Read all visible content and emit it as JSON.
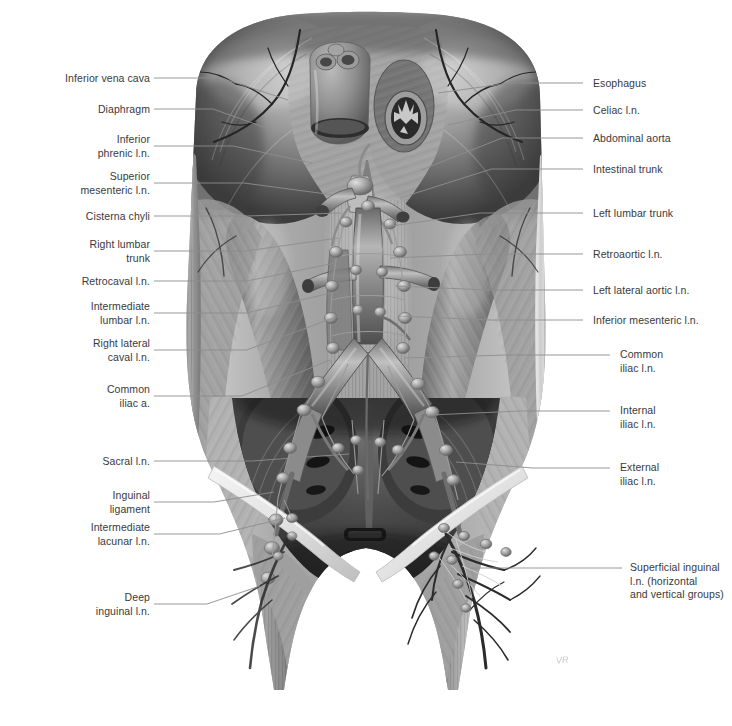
{
  "figure": {
    "background_color": "#ffffff",
    "label_color": "#39393b",
    "leader_color": "#8d8d90",
    "signature": "VR"
  },
  "labels_left": [
    {
      "id": "inferior-vena-cava",
      "text": "Inferior vena cava",
      "x": 35,
      "y": 72,
      "w": 115,
      "lx": 154,
      "ly": 78,
      "tx": 288,
      "ty": 100
    },
    {
      "id": "diaphragm",
      "text": "Diaphragm",
      "x": 35,
      "y": 103,
      "w": 115,
      "lx": 154,
      "ly": 109,
      "tx": 272,
      "ty": 130
    },
    {
      "id": "inferior-phrenic-ln",
      "text": "Inferior\nphrenic l.n.",
      "x": 35,
      "y": 133,
      "w": 115,
      "lx": 154,
      "ly": 146,
      "tx": 312,
      "ty": 163
    },
    {
      "id": "superior-mesenteric-ln",
      "text": "Superior\nmesenteric l.n.",
      "x": 25,
      "y": 170,
      "w": 125,
      "lx": 154,
      "ly": 183,
      "tx": 334,
      "ty": 195
    },
    {
      "id": "cisterna-chyli",
      "text": "Cisterna chyli",
      "x": 35,
      "y": 210,
      "w": 115,
      "lx": 154,
      "ly": 216,
      "tx": 341,
      "ty": 213
    },
    {
      "id": "right-lumbar-trunk",
      "text": "Right lumbar\ntrunk",
      "x": 35,
      "y": 238,
      "w": 115,
      "lx": 154,
      "ly": 251,
      "tx": 338,
      "ty": 238
    },
    {
      "id": "retrocaval-ln",
      "text": "Retrocaval l.n.",
      "x": 35,
      "y": 275,
      "w": 115,
      "lx": 154,
      "ly": 281,
      "tx": 340,
      "ty": 262
    },
    {
      "id": "intermediate-lumbar-ln",
      "text": "Intermediate\nlumbar l.n.",
      "x": 25,
      "y": 300,
      "w": 125,
      "lx": 154,
      "ly": 313,
      "tx": 339,
      "ty": 291
    },
    {
      "id": "right-lateral-caval-ln",
      "text": "Right lateral\ncaval l.n.",
      "x": 25,
      "y": 337,
      "w": 125,
      "lx": 154,
      "ly": 350,
      "tx": 339,
      "ty": 316
    },
    {
      "id": "common-iliac-a",
      "text": "Common\niliac a.",
      "x": 35,
      "y": 383,
      "w": 115,
      "lx": 154,
      "ly": 396,
      "tx": 330,
      "ty": 360
    },
    {
      "id": "sacral-ln",
      "text": "Sacral l.n.",
      "x": 35,
      "y": 455,
      "w": 115,
      "lx": 154,
      "ly": 461,
      "tx": 349,
      "ty": 454
    },
    {
      "id": "inguinal-ligament",
      "text": "Inguinal\nligament",
      "x": 35,
      "y": 489,
      "w": 115,
      "lx": 154,
      "ly": 502,
      "tx": 274,
      "ty": 492
    },
    {
      "id": "intermediate-lacunar-ln",
      "text": "Intermediate\nlacunar l.n.",
      "x": 25,
      "y": 521,
      "w": 125,
      "lx": 154,
      "ly": 534,
      "tx": 285,
      "ty": 518
    },
    {
      "id": "deep-inguinal-ln",
      "text": "Deep\ninguinal l.n.",
      "x": 35,
      "y": 591,
      "w": 115,
      "lx": 154,
      "ly": 604,
      "tx": 260,
      "ty": 586
    }
  ],
  "labels_right": [
    {
      "id": "esophagus",
      "text": "Esophagus",
      "x": 593,
      "y": 77,
      "w": 135,
      "lx": 583,
      "ly": 83,
      "tx": 438,
      "ty": 93
    },
    {
      "id": "celiac-ln",
      "text": "Celiac l.n.",
      "x": 593,
      "y": 104,
      "w": 135,
      "lx": 583,
      "ly": 110,
      "tx": 448,
      "ty": 125
    },
    {
      "id": "abdominal-aorta",
      "text": "Abdominal aorta",
      "x": 593,
      "y": 132,
      "w": 135,
      "lx": 583,
      "ly": 138,
      "tx": 421,
      "ty": 170
    },
    {
      "id": "intestinal-trunk",
      "text": "Intestinal trunk",
      "x": 593,
      "y": 163,
      "w": 135,
      "lx": 583,
      "ly": 169,
      "tx": 400,
      "ty": 198
    },
    {
      "id": "left-lumbar-trunk",
      "text": "Left lumbar trunk",
      "x": 593,
      "y": 207,
      "w": 135,
      "lx": 583,
      "ly": 213,
      "tx": 378,
      "ty": 228
    },
    {
      "id": "retroaortic-ln",
      "text": "Retroaortic l.n.",
      "x": 593,
      "y": 248,
      "w": 135,
      "lx": 583,
      "ly": 254,
      "tx": 390,
      "ty": 258
    },
    {
      "id": "left-lateral-aortic-ln",
      "text": "Left lateral aortic l.n.",
      "x": 593,
      "y": 284,
      "w": 135,
      "lx": 583,
      "ly": 290,
      "tx": 395,
      "ty": 286
    },
    {
      "id": "inferior-mesenteric-ln",
      "text": "Inferior mesenteric l.n.",
      "x": 593,
      "y": 314,
      "w": 135,
      "lx": 583,
      "ly": 320,
      "tx": 398,
      "ty": 316
    },
    {
      "id": "common-iliac-ln",
      "text": "Common\niliac l.n.",
      "x": 620,
      "y": 348,
      "w": 110,
      "lx": 610,
      "ly": 355,
      "tx": 404,
      "ty": 358
    },
    {
      "id": "internal-iliac-ln",
      "text": "Internal\niliac l.n.",
      "x": 620,
      "y": 404,
      "w": 110,
      "lx": 610,
      "ly": 411,
      "tx": 430,
      "ty": 415
    },
    {
      "id": "external-iliac-ln",
      "text": "External\niliac l.n.",
      "x": 620,
      "y": 461,
      "w": 110,
      "lx": 610,
      "ly": 468,
      "tx": 456,
      "ty": 462
    },
    {
      "id": "superficial-inguinal-ln",
      "text": "Superficial inguinal\nl.n. (horizontal\nand vertical groups)",
      "x": 630,
      "y": 561,
      "w": 100,
      "lx": 622,
      "ly": 568,
      "tx": 470,
      "ty": 568
    }
  ]
}
